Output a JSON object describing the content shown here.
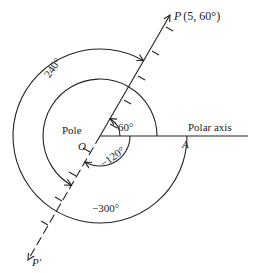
{
  "diagram": {
    "pole_label": "Pole",
    "origin_label": "O",
    "axis_label": "Polar axis",
    "axis_point_label": "A",
    "point_label": "P",
    "point_coords": "(5, 60°)",
    "opposite_point_label": "P′",
    "angles": {
      "a60": "60°",
      "a240": "240°",
      "neg120": "−120°",
      "neg300": "−300°"
    },
    "colors": {
      "ink": "#222222",
      "background": "#ffffff"
    }
  }
}
